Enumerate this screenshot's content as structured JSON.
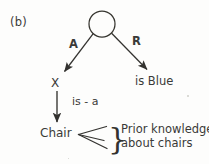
{
  "figure": {
    "panel_label": "(b)",
    "type": "semantic-network-diagram"
  },
  "nodes": [
    {
      "id": "root",
      "label": "",
      "shape": "circle",
      "cx": 102,
      "cy": 24,
      "r": 13
    },
    {
      "id": "x",
      "label": "X",
      "shape": "text",
      "x": 51,
      "y": 77
    },
    {
      "id": "is-blue",
      "label": "is Blue",
      "shape": "text",
      "x": 135,
      "y": 76
    },
    {
      "id": "chair",
      "label": "Chair",
      "shape": "text",
      "x": 40,
      "y": 127
    }
  ],
  "edges": [
    {
      "id": "root-to-x",
      "label": "A",
      "from": "root",
      "to": "x",
      "arrow": true
    },
    {
      "id": "root-to-is-blue",
      "label": "R",
      "from": "root",
      "to": "is-blue",
      "arrow": true
    },
    {
      "id": "x-to-chair",
      "label": "is - a",
      "from": "x",
      "to": "chair",
      "arrow": true
    }
  ],
  "annotation": {
    "brace": "}",
    "line1": "Prior knowledge",
    "line2": "about chairs",
    "fan_marker": "less-than-fan"
  },
  "colors": {
    "ink": "#33322f",
    "text": "#3a3a38",
    "background": "#fdfdfc",
    "speck": "#cfcfca"
  }
}
